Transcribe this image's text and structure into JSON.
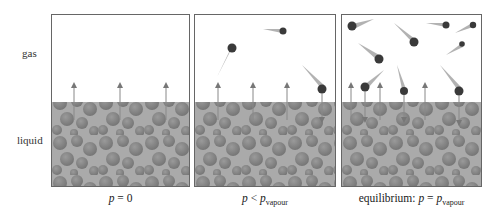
{
  "labels": {
    "gas": "gas",
    "liquid": "liquid"
  },
  "panels": [
    {
      "id": "p0",
      "caption_prefix": "",
      "caption_var": "p",
      "caption_op": " = ",
      "caption_rhs": "0",
      "caption_sub": ""
    },
    {
      "id": "plt",
      "caption_prefix": "",
      "caption_var": "p",
      "caption_op": " < ",
      "caption_rhs": "p",
      "caption_sub": "vapour"
    },
    {
      "id": "peq",
      "caption_prefix": "equilibrium: ",
      "caption_var": "p",
      "caption_op": " = ",
      "caption_rhs": "p",
      "caption_sub": "vapour"
    }
  ],
  "colors": {
    "liquid": "#a9a9a9",
    "sphere": "#858585",
    "arrow": "#888888",
    "comet": "#3a3a3a"
  }
}
